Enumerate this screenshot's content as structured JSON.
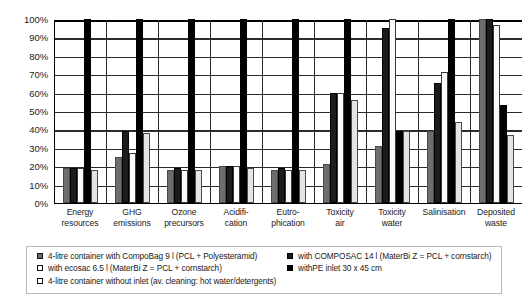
{
  "chart_data": {
    "type": "bar",
    "title": "",
    "xlabel": "",
    "ylabel": "",
    "ylim": [
      0,
      100
    ],
    "grid": true,
    "legend_position": "bottom",
    "y_ticks": [
      "0%",
      "10%",
      "20%",
      "30%",
      "40%",
      "50%",
      "60%",
      "70%",
      "80%",
      "90%",
      "100%"
    ],
    "categories": [
      "Energy resources",
      "GHG emissions",
      "Ozone precursors",
      "Acidification",
      "Eutrophication",
      "Toxicity air",
      "Toxicity water",
      "Salinisation",
      "Deposited waste"
    ],
    "category_lines": [
      [
        "Energy",
        "resources"
      ],
      [
        "GHG",
        "emissions"
      ],
      [
        "Ozone",
        "precursors"
      ],
      [
        "Acidifi-",
        "cation"
      ],
      [
        "Eutro-",
        "phication"
      ],
      [
        "Toxicity",
        "air"
      ],
      [
        "Toxicity",
        "water"
      ],
      [
        "Salinisation",
        ""
      ],
      [
        "Deposited",
        "waste"
      ]
    ],
    "series": [
      {
        "name": "4-litre container with CompoBag 9 l (PCL + Polyesteramid)",
        "swatch": "s0",
        "color": "#6e6e6e",
        "values": [
          19,
          25,
          18,
          20,
          18,
          21,
          31,
          39,
          100
        ]
      },
      {
        "name": "with COMPOSAC 14 l (MaterBi Z = PCL + cornstarch)",
        "swatch": "s1",
        "color": "#1c1c1c",
        "values": [
          19,
          39,
          19,
          20,
          19,
          60,
          95,
          65,
          100
        ]
      },
      {
        "name": "with ecosac 6.5 l (MaterBi Z = PCL + cornstarch)",
        "swatch": "s2",
        "color": "#fbfbfb",
        "values": [
          19,
          27,
          18,
          20,
          18,
          60,
          100,
          71,
          97
        ]
      },
      {
        "name": "withPE inlet 30 x 45 cm",
        "swatch": "s3",
        "color": "#000000",
        "values": [
          100,
          100,
          100,
          100,
          100,
          100,
          39,
          100,
          53
        ]
      },
      {
        "name": "4-litre container without inlet (av. cleaning: hot water/detergents)",
        "swatch": "s4",
        "color": "#e4e4e4",
        "values": [
          18,
          38,
          18,
          19,
          18,
          56,
          39,
          44,
          37
        ]
      }
    ]
  },
  "legend": {
    "rows": [
      {
        "left": {
          "swatch": "s0",
          "label": "4-litre container with CompoBag 9 l (PCL + Polyesteramid)"
        },
        "right": {
          "swatch": "s1",
          "label": "with COMPOSAC 14 l (MaterBi Z = PCL + cornstarch)"
        }
      },
      {
        "left": {
          "swatch": "s2",
          "label": "with ecosac 6.5 l (MaterBi Z = PCL + cornstarch)"
        },
        "right": {
          "swatch": "s3",
          "label": "withPE inlet 30 x 45 cm"
        }
      },
      {
        "left": {
          "swatch": "s4",
          "label": "4-litre container without inlet (av. cleaning: hot water/detergents)"
        },
        "right": null
      }
    ]
  }
}
